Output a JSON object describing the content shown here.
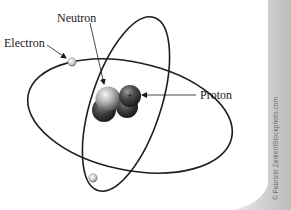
{
  "diagram": {
    "type": "atom-model",
    "labels": {
      "electron": "Electron",
      "neutron": "Neutron",
      "proton": "Proton"
    },
    "nucleus": {
      "neutron_symbol": "",
      "proton_symbol": "+"
    },
    "electron_count": 2,
    "orbit_count": 2,
    "credit": "© Fabrizio Zanier/iStockphoto.com"
  },
  "colors": {
    "background": "#ffffff",
    "orbit": "#1e1e1e",
    "label_text": "#1a1a1a",
    "neutron": "#b8b8b8",
    "proton": "#3a3a3a",
    "side_strip": "#d6d6d6"
  }
}
